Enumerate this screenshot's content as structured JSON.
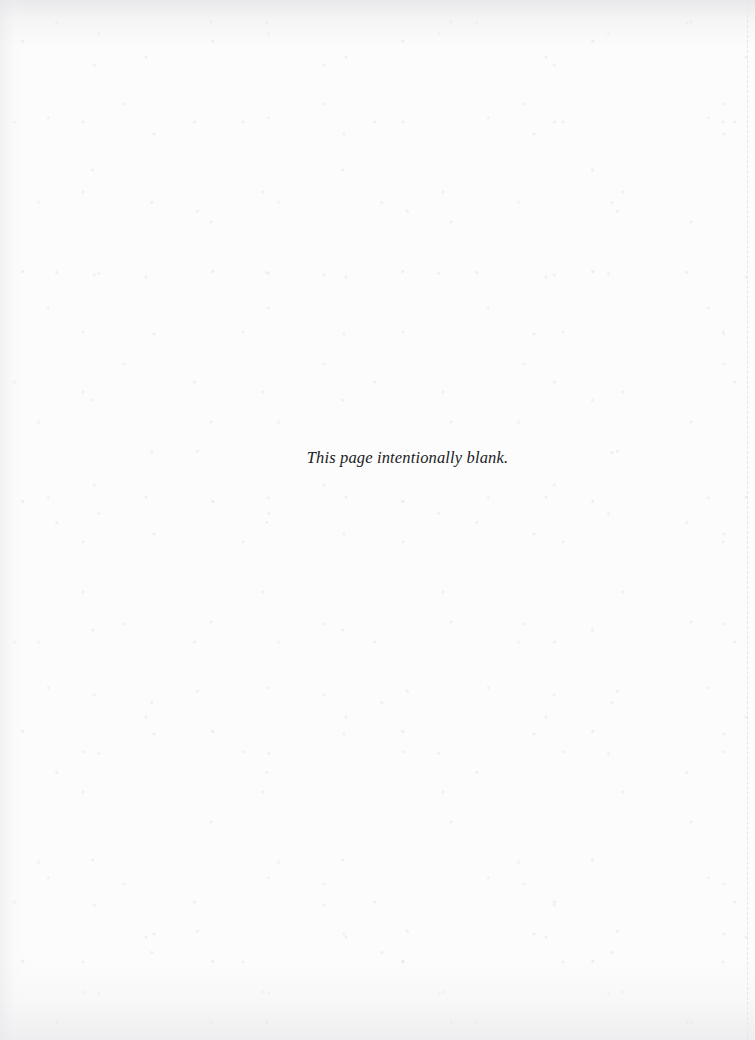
{
  "page": {
    "kind": "scanned-book-page",
    "notice": "This page intentionally blank.",
    "colors": {
      "paper": "#fcfcfc",
      "ink": "#1b1b1d",
      "edge_rule": "#e6e6e8",
      "scan_shadow": "#e6e6e9"
    },
    "marks": {
      "right_edge_rule_style": "dashed",
      "grain": "speckled scan texture"
    }
  }
}
